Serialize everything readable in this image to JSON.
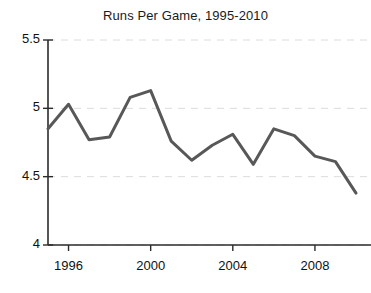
{
  "chart_data": {
    "type": "line",
    "title": "Runs Per Game, 1995-2010",
    "xlabel": "",
    "ylabel": "",
    "x": [
      1995,
      1996,
      1997,
      1998,
      1999,
      2000,
      2001,
      2002,
      2003,
      2004,
      2005,
      2006,
      2007,
      2008,
      2009,
      2010
    ],
    "values": [
      4.85,
      5.03,
      4.77,
      4.79,
      5.08,
      5.13,
      4.76,
      4.62,
      4.73,
      4.81,
      4.59,
      4.85,
      4.8,
      4.65,
      4.61,
      4.38
    ],
    "series": [
      {
        "name": "Runs Per Game",
        "values": [
          4.85,
          5.03,
          4.77,
          4.79,
          5.08,
          5.13,
          4.76,
          4.62,
          4.73,
          4.81,
          4.59,
          4.85,
          4.8,
          4.65,
          4.61,
          4.38
        ]
      }
    ],
    "xlim": [
      1995,
      2010
    ],
    "ylim": [
      4,
      5.5
    ],
    "ytick_labels": [
      "5.5",
      "5",
      "4.5",
      "4"
    ],
    "ytick_values": [
      5.5,
      5,
      4.5,
      4
    ],
    "xtick_labels": [
      "1996",
      "2000",
      "2004",
      "2008"
    ],
    "xtick_values": [
      1996,
      2000,
      2004,
      2008
    ],
    "grid": true,
    "grid_axis": "y",
    "grid_style": "dashed",
    "legend": false,
    "legend_position": "none",
    "colors": {
      "line": "#585858",
      "grid": "#dcdcdc",
      "axis": "#2b2b2b",
      "text": "#111111",
      "background": "#ffffff"
    },
    "line_width": 3
  }
}
